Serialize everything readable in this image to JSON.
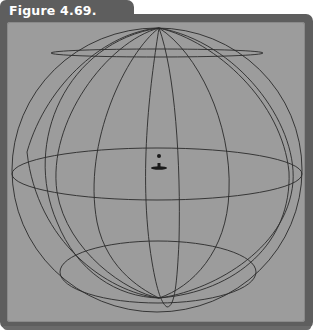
{
  "figure": {
    "label": "Figure 4.69."
  },
  "viewport": {
    "background": "#9c9c9c",
    "frame_color": "#5e5e5e",
    "line_color": "#2a2a2a",
    "content": "wireframe-sphere",
    "center_marker": "light-icon"
  }
}
